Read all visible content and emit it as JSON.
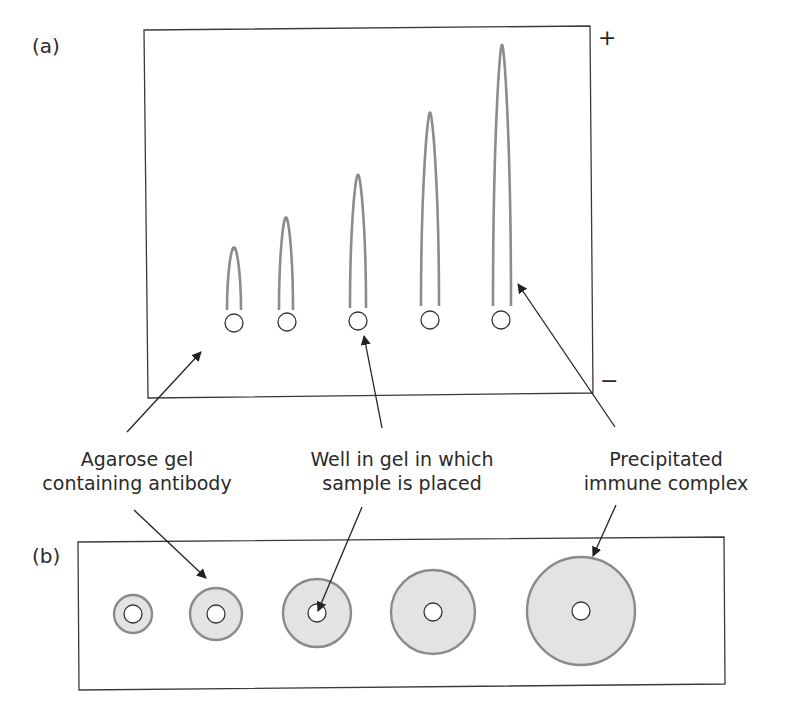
{
  "panel_a": {
    "label": "(a)",
    "plus_label": "+",
    "minus_label": "−",
    "frame": {
      "x1": 144,
      "y1": 30,
      "x2": 593,
      "y2": 395
    },
    "rockets": [
      {
        "x": 234,
        "tip_y": 248,
        "base_y": 310,
        "half_width": 7
      },
      {
        "x": 286,
        "tip_y": 218,
        "base_y": 310,
        "half_width": 7
      },
      {
        "x": 358,
        "tip_y": 175,
        "base_y": 308,
        "half_width": 8
      },
      {
        "x": 430,
        "tip_y": 113,
        "base_y": 306,
        "half_width": 9
      },
      {
        "x": 502,
        "tip_y": 45,
        "base_y": 306,
        "half_width": 9
      }
    ],
    "wells": [
      {
        "cx": 234,
        "cy": 323,
        "r": 9
      },
      {
        "cx": 287,
        "cy": 322,
        "r": 9
      },
      {
        "cx": 358,
        "cy": 321,
        "r": 9
      },
      {
        "cx": 430,
        "cy": 320,
        "r": 9
      },
      {
        "cx": 501,
        "cy": 320,
        "r": 9
      }
    ]
  },
  "panel_b": {
    "label": "(b)",
    "frame": {
      "x1": 78,
      "y1": 540,
      "x2": 724,
      "y2": 688
    },
    "rings": [
      {
        "cx": 133,
        "cy": 614,
        "outer_r": 19,
        "inner_r": 9
      },
      {
        "cx": 216,
        "cy": 614,
        "outer_r": 26,
        "inner_r": 9
      },
      {
        "cx": 317,
        "cy": 613,
        "outer_r": 34,
        "inner_r": 9
      },
      {
        "cx": 433,
        "cy": 612,
        "outer_r": 42,
        "inner_r": 9
      },
      {
        "cx": 581,
        "cy": 611,
        "outer_r": 54,
        "inner_r": 9
      }
    ]
  },
  "callouts": {
    "agarose": {
      "line1": "Agarose gel",
      "line2": "containing antibody"
    },
    "well": {
      "line1": "Well in gel in which",
      "line2": "sample is placed"
    },
    "precipitate": {
      "line1": "Precipitated",
      "line2": "immune complex"
    }
  },
  "colors": {
    "rocket_stroke": "#8c8c8c",
    "frame_stroke": "#3a3a3a",
    "ring_fill": "#e3e3e3",
    "ring_stroke": "#8a8a8a",
    "well_stroke": "#333333",
    "arrow": "#222222",
    "text": "#2a2a2a"
  }
}
